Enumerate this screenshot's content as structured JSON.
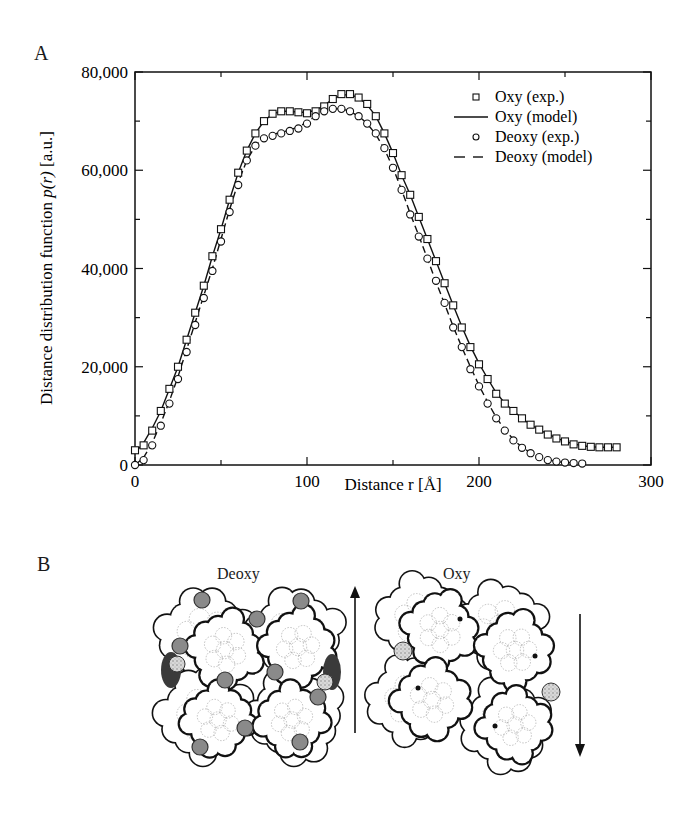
{
  "panel_a": {
    "label": "A"
  },
  "panel_b": {
    "label": "B",
    "deoxy_title": "Deoxy",
    "oxy_title": "Oxy",
    "deoxy_arrow": "up-arrow",
    "oxy_arrow": "down-arrow"
  },
  "chart_data": {
    "type": "scatter",
    "title": "",
    "xlabel": "Distance r [Å]",
    "ylabel_prefix": "Distance distribution function ",
    "ylabel_italic": "p(r)",
    "ylabel_suffix": " [a.u.]",
    "ylabel": "Distance distribution function p(r) [a.u.]",
    "xlim": [
      0,
      300
    ],
    "ylim": [
      0,
      80000
    ],
    "x_ticks": [
      0,
      100,
      200,
      300
    ],
    "x_tick_labels": [
      "0",
      "100",
      "200",
      "300"
    ],
    "y_ticks": [
      0,
      20000,
      40000,
      60000,
      80000
    ],
    "y_tick_labels": [
      "0",
      "20,000",
      "40,000",
      "60,000",
      "80,000"
    ],
    "grid": false,
    "legend_position": "upper right",
    "legend": [
      {
        "label": "Oxy (exp.)",
        "marker": "square",
        "line": "none"
      },
      {
        "label": "Oxy (model)",
        "marker": "none",
        "line": "solid"
      },
      {
        "label": "Deoxy (exp.)",
        "marker": "circle",
        "line": "none"
      },
      {
        "label": "Deoxy (model)",
        "marker": "none",
        "line": "dashed"
      }
    ],
    "series": [
      {
        "name": "Oxy (exp.)",
        "style": "square",
        "x": [
          0,
          5,
          10,
          15,
          20,
          25,
          30,
          35,
          40,
          45,
          50,
          55,
          60,
          65,
          70,
          75,
          80,
          85,
          90,
          95,
          100,
          105,
          110,
          115,
          120,
          125,
          130,
          135,
          140,
          145,
          150,
          155,
          160,
          165,
          170,
          175,
          180,
          185,
          190,
          195,
          200,
          205,
          210,
          215,
          220,
          225,
          230,
          235,
          240,
          245,
          250,
          255,
          260,
          265,
          270,
          275,
          280
        ],
        "y": [
          3000,
          4000,
          7000,
          11000,
          15500,
          20000,
          25500,
          31000,
          36500,
          42500,
          48000,
          54000,
          59500,
          64000,
          67500,
          70000,
          71500,
          72000,
          72000,
          71800,
          71600,
          72000,
          73000,
          74500,
          75500,
          75500,
          74800,
          73500,
          71000,
          67500,
          63500,
          59000,
          55000,
          50500,
          46000,
          41500,
          37000,
          32500,
          28000,
          24000,
          20500,
          17500,
          14500,
          12500,
          11000,
          9500,
          8200,
          7200,
          6200,
          5400,
          4800,
          4200,
          3900,
          3700,
          3600,
          3600,
          3600
        ]
      },
      {
        "name": "Oxy (model)",
        "style": "solid",
        "x": [
          0,
          5,
          10,
          15,
          20,
          25,
          30,
          35,
          40,
          45,
          50,
          55,
          60,
          65,
          70,
          75,
          80,
          85,
          90,
          95,
          100,
          105,
          110,
          115,
          120,
          125,
          130,
          135,
          140,
          145,
          150,
          155,
          160,
          165,
          170,
          175,
          180,
          185,
          190,
          195,
          200,
          205,
          210,
          215,
          220,
          225,
          230,
          235,
          240,
          245,
          250,
          255,
          260,
          265,
          270,
          275,
          280
        ],
        "y": [
          2500,
          4500,
          7500,
          11000,
          15500,
          20000,
          25500,
          31000,
          36500,
          42500,
          48000,
          54000,
          59500,
          64000,
          67500,
          70000,
          71500,
          72000,
          72000,
          71800,
          71800,
          72200,
          73200,
          74500,
          75300,
          75400,
          74800,
          73300,
          71000,
          67500,
          63500,
          59000,
          55000,
          50500,
          46000,
          41500,
          37000,
          32500,
          28200,
          24200,
          20700,
          17600,
          14700,
          12600,
          11000,
          9500,
          8200,
          7200,
          6300,
          5500,
          4800,
          4300,
          3900,
          3700,
          3600,
          3600,
          3600
        ]
      },
      {
        "name": "Deoxy (exp.)",
        "style": "circle",
        "x": [
          0,
          5,
          10,
          15,
          20,
          25,
          30,
          35,
          40,
          45,
          50,
          55,
          60,
          65,
          70,
          75,
          80,
          85,
          90,
          95,
          100,
          105,
          110,
          115,
          120,
          125,
          130,
          135,
          140,
          145,
          150,
          155,
          160,
          165,
          170,
          175,
          180,
          185,
          190,
          195,
          200,
          205,
          210,
          215,
          220,
          225,
          230,
          235,
          240,
          245,
          250,
          255,
          260
        ],
        "y": [
          0,
          1000,
          4000,
          8000,
          12500,
          17500,
          23000,
          28500,
          34000,
          39500,
          45500,
          51500,
          57000,
          62000,
          65000,
          66500,
          67000,
          67500,
          68000,
          68500,
          69500,
          71000,
          72000,
          72500,
          72500,
          72000,
          71000,
          69500,
          67500,
          64500,
          60500,
          56000,
          51000,
          46500,
          42000,
          37500,
          33000,
          28000,
          24000,
          19500,
          16000,
          12500,
          9500,
          7000,
          5000,
          3500,
          2400,
          1600,
          1000,
          700,
          500,
          400,
          300
        ]
      },
      {
        "name": "Deoxy (model)",
        "style": "dashed",
        "x": [
          0,
          5,
          10,
          15,
          20,
          25,
          30,
          35,
          40,
          45,
          50,
          55,
          60,
          65,
          70,
          75,
          80,
          85,
          90,
          95,
          100,
          105,
          110,
          115,
          120,
          125,
          130,
          135,
          140,
          145,
          150,
          155,
          160,
          165,
          170,
          175,
          180,
          185,
          190,
          195,
          200,
          205,
          210,
          215,
          220,
          225,
          230,
          235,
          240,
          245,
          250,
          255,
          260
        ],
        "y": [
          0,
          1500,
          4500,
          8500,
          13000,
          18000,
          23500,
          29000,
          34500,
          40000,
          46000,
          52000,
          57500,
          62000,
          65000,
          66800,
          67300,
          67700,
          68200,
          68800,
          69800,
          71000,
          72000,
          72500,
          72500,
          72000,
          71000,
          69500,
          67300,
          64300,
          60500,
          56000,
          51200,
          46700,
          42000,
          37300,
          32800,
          28200,
          24000,
          20000,
          16200,
          12800,
          9700,
          7200,
          5200,
          3600,
          2500,
          1700,
          1100,
          700,
          500,
          400,
          300
        ]
      }
    ]
  }
}
